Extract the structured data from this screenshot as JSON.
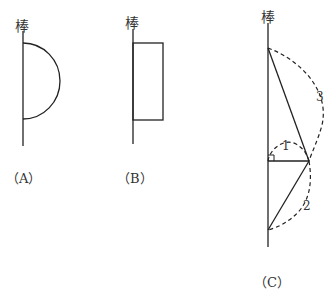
{
  "figures": {
    "A": {
      "rod_label": "棒",
      "caption": "（A）",
      "shape": "semicircle"
    },
    "B": {
      "rod_label": "棒",
      "caption": "（B）",
      "shape": "rectangle"
    },
    "C": {
      "rod_label": "棒",
      "caption": "（C）",
      "arc_labels": {
        "arc1": "1",
        "arc2": "2",
        "arc3": "3"
      },
      "right_angle_marker": true
    }
  },
  "colors": {
    "stroke": "#222222",
    "background": "#ffffff"
  }
}
